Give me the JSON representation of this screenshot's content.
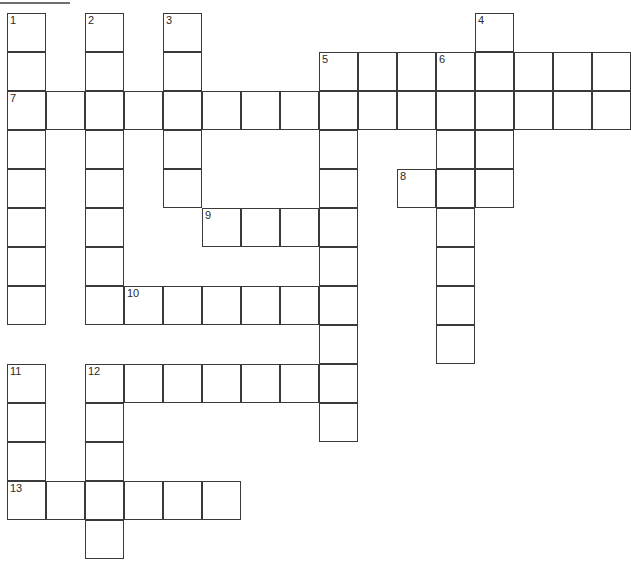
{
  "puzzle": {
    "type": "crossword-grid",
    "title": "",
    "grid_columns": 16,
    "grid_rows": 14,
    "cell_size_px": 39,
    "origin_x_px": 7,
    "origin_y_px": 13,
    "colors": {
      "cell_fill": "#ffffff",
      "cell_border": "#3a3a3a",
      "page_background": "#ffffff",
      "number_text": "#2a2a2a",
      "top_rule": "#6f6f6f"
    },
    "top_rule": {
      "x": 0,
      "y": 2,
      "width": 70,
      "height": 2
    },
    "clue_numbers": [
      {
        "number": "1",
        "col": 0,
        "row": 0
      },
      {
        "number": "2",
        "col": 2,
        "row": 0
      },
      {
        "number": "3",
        "col": 4,
        "row": 0
      },
      {
        "number": "4",
        "col": 12,
        "row": 0
      },
      {
        "number": "5",
        "col": 8,
        "row": 1
      },
      {
        "number": "6",
        "col": 11,
        "row": 1
      },
      {
        "number": "7",
        "col": 0,
        "row": 2
      },
      {
        "number": "8",
        "col": 10,
        "row": 4
      },
      {
        "number": "9",
        "col": 5,
        "row": 5
      },
      {
        "number": "10",
        "col": 3,
        "row": 7
      },
      {
        "number": "11",
        "col": 0,
        "row": 9
      },
      {
        "number": "12",
        "col": 2,
        "row": 9
      },
      {
        "number": "13",
        "col": 0,
        "row": 12
      }
    ],
    "entries": [
      {
        "number": "1",
        "direction": "down",
        "col": 0,
        "row": 0,
        "length": 8
      },
      {
        "number": "2",
        "direction": "down",
        "col": 2,
        "row": 0,
        "length": 8
      },
      {
        "number": "3",
        "direction": "down",
        "col": 4,
        "row": 0,
        "length": 5
      },
      {
        "number": "4",
        "direction": "down",
        "col": 12,
        "row": 0,
        "length": 5
      },
      {
        "number": "5",
        "direction": "across",
        "col": 8,
        "row": 1,
        "length": 8
      },
      {
        "number": "5",
        "direction": "down",
        "col": 8,
        "row": 1,
        "length": 9
      },
      {
        "number": "6",
        "direction": "down",
        "col": 11,
        "row": 1,
        "length": 8
      },
      {
        "number": "7",
        "direction": "across",
        "col": 0,
        "row": 2,
        "length": 16
      },
      {
        "number": "8",
        "direction": "across",
        "col": 10,
        "row": 4,
        "length": 3
      },
      {
        "number": "9",
        "direction": "across",
        "col": 5,
        "row": 5,
        "length": 4
      },
      {
        "number": "10",
        "direction": "across",
        "col": 3,
        "row": 7,
        "length": 6
      },
      {
        "number": "11",
        "direction": "down",
        "col": 0,
        "row": 9,
        "length": 4
      },
      {
        "number": "12",
        "direction": "across",
        "col": 2,
        "row": 9,
        "length": 7
      },
      {
        "number": "12",
        "direction": "down",
        "col": 2,
        "row": 9,
        "length": 5
      },
      {
        "number": "13",
        "direction": "across",
        "col": 0,
        "row": 12,
        "length": 6
      }
    ],
    "cells": [
      {
        "col": 0,
        "row": 0,
        "number": "1"
      },
      {
        "col": 0,
        "row": 1,
        "number": ""
      },
      {
        "col": 0,
        "row": 2,
        "number": "7"
      },
      {
        "col": 0,
        "row": 3,
        "number": ""
      },
      {
        "col": 0,
        "row": 4,
        "number": ""
      },
      {
        "col": 0,
        "row": 5,
        "number": ""
      },
      {
        "col": 0,
        "row": 6,
        "number": ""
      },
      {
        "col": 0,
        "row": 7,
        "number": ""
      },
      {
        "col": 1,
        "row": 2,
        "number": ""
      },
      {
        "col": 2,
        "row": 0,
        "number": "2"
      },
      {
        "col": 2,
        "row": 1,
        "number": ""
      },
      {
        "col": 2,
        "row": 2,
        "number": ""
      },
      {
        "col": 2,
        "row": 3,
        "number": ""
      },
      {
        "col": 2,
        "row": 4,
        "number": ""
      },
      {
        "col": 2,
        "row": 5,
        "number": ""
      },
      {
        "col": 2,
        "row": 6,
        "number": ""
      },
      {
        "col": 2,
        "row": 7,
        "number": ""
      },
      {
        "col": 3,
        "row": 2,
        "number": ""
      },
      {
        "col": 3,
        "row": 7,
        "number": "10"
      },
      {
        "col": 4,
        "row": 0,
        "number": "3"
      },
      {
        "col": 4,
        "row": 1,
        "number": ""
      },
      {
        "col": 4,
        "row": 2,
        "number": ""
      },
      {
        "col": 4,
        "row": 3,
        "number": ""
      },
      {
        "col": 4,
        "row": 4,
        "number": ""
      },
      {
        "col": 4,
        "row": 7,
        "number": ""
      },
      {
        "col": 5,
        "row": 2,
        "number": ""
      },
      {
        "col": 5,
        "row": 5,
        "number": "9"
      },
      {
        "col": 5,
        "row": 7,
        "number": ""
      },
      {
        "col": 6,
        "row": 2,
        "number": ""
      },
      {
        "col": 6,
        "row": 5,
        "number": ""
      },
      {
        "col": 6,
        "row": 7,
        "number": ""
      },
      {
        "col": 7,
        "row": 2,
        "number": ""
      },
      {
        "col": 7,
        "row": 5,
        "number": ""
      },
      {
        "col": 7,
        "row": 7,
        "number": ""
      },
      {
        "col": 8,
        "row": 1,
        "number": "5"
      },
      {
        "col": 8,
        "row": 2,
        "number": ""
      },
      {
        "col": 8,
        "row": 3,
        "number": ""
      },
      {
        "col": 8,
        "row": 4,
        "number": ""
      },
      {
        "col": 8,
        "row": 5,
        "number": ""
      },
      {
        "col": 8,
        "row": 6,
        "number": ""
      },
      {
        "col": 8,
        "row": 7,
        "number": ""
      },
      {
        "col": 8,
        "row": 8,
        "number": ""
      },
      {
        "col": 8,
        "row": 9,
        "number": ""
      },
      {
        "col": 8,
        "row": 10,
        "number": ""
      },
      {
        "col": 9,
        "row": 1,
        "number": ""
      },
      {
        "col": 9,
        "row": 2,
        "number": ""
      },
      {
        "col": 10,
        "row": 1,
        "number": ""
      },
      {
        "col": 10,
        "row": 2,
        "number": ""
      },
      {
        "col": 10,
        "row": 4,
        "number": "8"
      },
      {
        "col": 11,
        "row": 1,
        "number": "6"
      },
      {
        "col": 11,
        "row": 2,
        "number": ""
      },
      {
        "col": 11,
        "row": 3,
        "number": ""
      },
      {
        "col": 11,
        "row": 4,
        "number": ""
      },
      {
        "col": 11,
        "row": 5,
        "number": ""
      },
      {
        "col": 11,
        "row": 6,
        "number": ""
      },
      {
        "col": 11,
        "row": 7,
        "number": ""
      },
      {
        "col": 11,
        "row": 8,
        "number": ""
      },
      {
        "col": 12,
        "row": 0,
        "number": "4"
      },
      {
        "col": 12,
        "row": 1,
        "number": ""
      },
      {
        "col": 12,
        "row": 2,
        "number": ""
      },
      {
        "col": 12,
        "row": 3,
        "number": ""
      },
      {
        "col": 12,
        "row": 4,
        "number": ""
      },
      {
        "col": 13,
        "row": 1,
        "number": ""
      },
      {
        "col": 13,
        "row": 2,
        "number": ""
      },
      {
        "col": 14,
        "row": 1,
        "number": ""
      },
      {
        "col": 14,
        "row": 2,
        "number": ""
      },
      {
        "col": 15,
        "row": 1,
        "number": ""
      },
      {
        "col": 15,
        "row": 2,
        "number": ""
      },
      {
        "col": 0,
        "row": 9,
        "number": "11"
      },
      {
        "col": 0,
        "row": 10,
        "number": ""
      },
      {
        "col": 0,
        "row": 11,
        "number": ""
      },
      {
        "col": 0,
        "row": 12,
        "number": "13"
      },
      {
        "col": 1,
        "row": 12,
        "number": ""
      },
      {
        "col": 2,
        "row": 9,
        "number": "12"
      },
      {
        "col": 2,
        "row": 10,
        "number": ""
      },
      {
        "col": 2,
        "row": 11,
        "number": ""
      },
      {
        "col": 2,
        "row": 12,
        "number": ""
      },
      {
        "col": 2,
        "row": 13,
        "number": ""
      },
      {
        "col": 3,
        "row": 9,
        "number": ""
      },
      {
        "col": 3,
        "row": 12,
        "number": ""
      },
      {
        "col": 4,
        "row": 9,
        "number": ""
      },
      {
        "col": 4,
        "row": 12,
        "number": ""
      },
      {
        "col": 5,
        "row": 9,
        "number": ""
      },
      {
        "col": 5,
        "row": 12,
        "number": ""
      },
      {
        "col": 6,
        "row": 9,
        "number": ""
      },
      {
        "col": 7,
        "row": 9,
        "number": ""
      }
    ]
  }
}
